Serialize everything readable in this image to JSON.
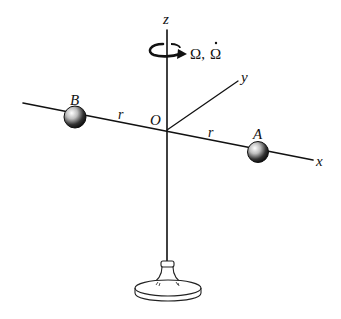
{
  "diagram": {
    "axes": {
      "z_label": "z",
      "y_label": "y",
      "x_label": "x",
      "origin_label": "O"
    },
    "masses": [
      {
        "id": "A",
        "label": "A"
      },
      {
        "id": "B",
        "label": "B"
      }
    ],
    "distances": {
      "left_label": "r",
      "right_label": "r"
    },
    "rotation": {
      "label_omega": "Ω,",
      "label_omega_dot": "Ω"
    },
    "colors": {
      "ink": "#111111",
      "background": "#ffffff"
    }
  }
}
